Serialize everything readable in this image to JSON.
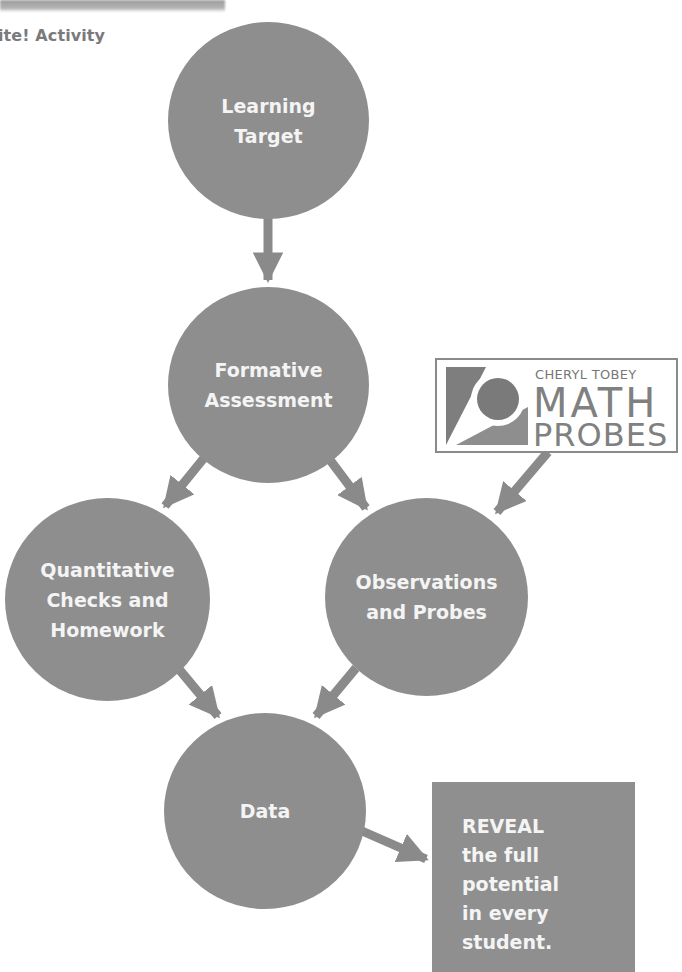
{
  "header": {
    "title": "ite! Activity"
  },
  "colors": {
    "node_fill": "#8e8e8e",
    "arrow": "#8a8a8a",
    "label_text": "#f4f4f4",
    "heading_text": "#7a7a7a"
  },
  "nodes": [
    {
      "id": "learning-target",
      "label": "Learning\nTarget"
    },
    {
      "id": "formative-assessment",
      "label": "Formative\nAssessment"
    },
    {
      "id": "quantitative-checks",
      "label": "Quantitative\nChecks and\nHomework"
    },
    {
      "id": "observations-probes",
      "label": "Observations\nand Probes"
    },
    {
      "id": "data",
      "label": "Data"
    }
  ],
  "edges": [
    {
      "from": "learning-target",
      "to": "formative-assessment"
    },
    {
      "from": "formative-assessment",
      "to": "quantitative-checks"
    },
    {
      "from": "formative-assessment",
      "to": "observations-probes"
    },
    {
      "from": "math-probes-logo",
      "to": "observations-probes"
    },
    {
      "from": "quantitative-checks",
      "to": "data"
    },
    {
      "from": "observations-probes",
      "to": "data"
    },
    {
      "from": "data",
      "to": "reveal-box"
    }
  ],
  "logo": {
    "line1": "CHERYL TOBEY",
    "line2": "MATH",
    "line3": "PROBES"
  },
  "reveal": {
    "text": "REVEAL\nthe full\npotential\nin every\nstudent."
  }
}
